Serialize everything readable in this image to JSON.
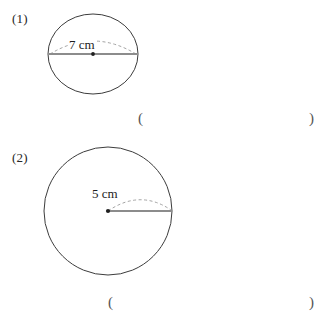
{
  "page": {
    "background_color": "#ffffff",
    "stroke_color": "#3c3c3c",
    "measure_line_color": "#8c8c8c",
    "dash_color": "#9a9a9a"
  },
  "problems": [
    {
      "number": "(1)",
      "figure": {
        "shape": "circle",
        "measurement_type": "diameter",
        "measurement_label": "7 cm",
        "center_dot": true
      },
      "answer": {
        "open_paren": "(",
        "close_paren": ")",
        "value": ""
      }
    },
    {
      "number": "(2)",
      "figure": {
        "shape": "circle",
        "measurement_type": "radius",
        "measurement_label": "5 cm",
        "center_dot": true
      },
      "answer": {
        "open_paren": "(",
        "close_paren": ")",
        "value": ""
      }
    }
  ]
}
